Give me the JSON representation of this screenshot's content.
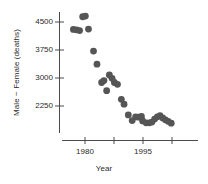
{
  "chart_data": {
    "type": "scatter",
    "title": "",
    "xlabel": "Year",
    "ylabel": "Male − Female (deaths)",
    "xlim": [
      1976,
      2003
    ],
    "ylim": [
      1650,
      4800
    ],
    "grid": false,
    "legend": null,
    "marker": {
      "shape": "circle",
      "color": "#555555",
      "size": 3.4
    },
    "y_ticks": [
      2250,
      3000,
      3750,
      4500
    ],
    "y_tick_labels": [
      "2250",
      "3000",
      "3750",
      "4500"
    ],
    "x_ticks": [
      1980,
      1987.5,
      1995,
      2002.5
    ],
    "x_tick_labels": [
      "1980",
      "",
      "1995",
      ""
    ],
    "x_labeled_ticks": [
      {
        "value": 1980,
        "label": "1980"
      },
      {
        "value": 1995,
        "label": "1995"
      }
    ],
    "series": [
      {
        "name": "Male − Female (deaths)",
        "points": [
          {
            "x": 1977.0,
            "y": 4300
          },
          {
            "x": 1977.8,
            "y": 4290
          },
          {
            "x": 1978.6,
            "y": 4270
          },
          {
            "x": 1979.4,
            "y": 4640
          },
          {
            "x": 1980.1,
            "y": 4660
          },
          {
            "x": 1980.9,
            "y": 4310
          },
          {
            "x": 1982.2,
            "y": 3720
          },
          {
            "x": 1983.1,
            "y": 3370
          },
          {
            "x": 1984.3,
            "y": 2880
          },
          {
            "x": 1984.9,
            "y": 2930
          },
          {
            "x": 1985.6,
            "y": 2660
          },
          {
            "x": 1986.3,
            "y": 3080
          },
          {
            "x": 1987.0,
            "y": 2990
          },
          {
            "x": 1987.6,
            "y": 2880
          },
          {
            "x": 1988.4,
            "y": 2830
          },
          {
            "x": 1989.4,
            "y": 2430
          },
          {
            "x": 1990.1,
            "y": 2300
          },
          {
            "x": 1991.2,
            "y": 2010
          },
          {
            "x": 1992.2,
            "y": 1860
          },
          {
            "x": 1993.1,
            "y": 1960
          },
          {
            "x": 1993.8,
            "y": 1950
          },
          {
            "x": 1994.6,
            "y": 1970
          },
          {
            "x": 1994.9,
            "y": 1850
          },
          {
            "x": 1995.8,
            "y": 1800
          },
          {
            "x": 1996.6,
            "y": 1800
          },
          {
            "x": 1997.3,
            "y": 1820
          },
          {
            "x": 1998.0,
            "y": 1900
          },
          {
            "x": 1998.7,
            "y": 1960
          },
          {
            "x": 1999.4,
            "y": 1990
          },
          {
            "x": 2000.1,
            "y": 1930
          },
          {
            "x": 2000.8,
            "y": 1880
          },
          {
            "x": 2001.5,
            "y": 1840
          },
          {
            "x": 2002.3,
            "y": 1790
          }
        ]
      }
    ]
  },
  "axes": {
    "y_axis_line_color": "#4a4a4a",
    "x_axis_line_color": "#4a4a4a"
  }
}
